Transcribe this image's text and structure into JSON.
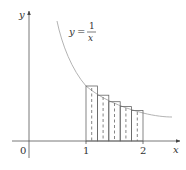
{
  "diagram": {
    "function_label": {
      "lhs": "y",
      "eq": "=",
      "numerator": "1",
      "denominator": "x"
    },
    "axes": {
      "x_label": "x",
      "y_label": "y",
      "origin_label": "0"
    },
    "ticks": [
      {
        "value": 1,
        "label": "1"
      },
      {
        "value": 2,
        "label": "2"
      }
    ],
    "rectangles": {
      "interval": [
        1,
        2
      ],
      "n": 5,
      "endpoint": "left",
      "heights": [
        1.0,
        0.833,
        0.714,
        0.625,
        0.556
      ],
      "midpoint_dashed_lines": true
    },
    "colors": {
      "axis": "#555555",
      "curve": "#aaaaaa",
      "rect": "#666666",
      "text": "#333333"
    }
  }
}
